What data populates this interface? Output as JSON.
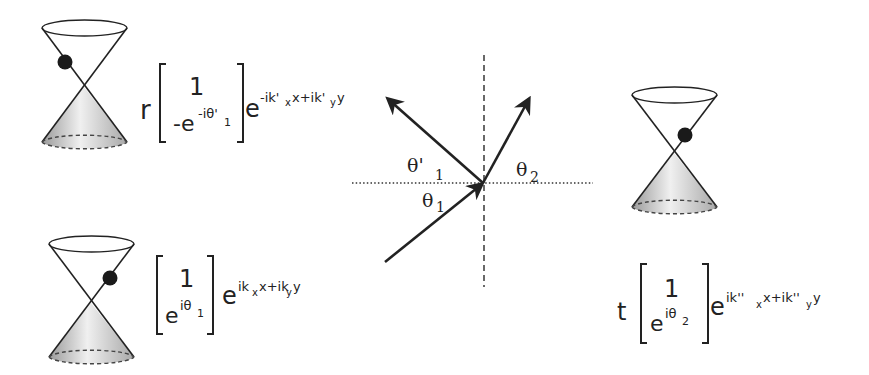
{
  "diagram": {
    "colors": {
      "ink": "#222222",
      "cone_fill_light": "#f2f2f2",
      "cone_fill_dark": "#b8b8b8",
      "ball": "#1a1a1a",
      "background": "#ffffff"
    },
    "reflected": {
      "coefficient": "r",
      "spinor_top": "1",
      "spinor_bottom": "-e",
      "spinor_bottom_exp": "-iθ'",
      "spinor_bottom_sub": "1",
      "exp_base": "e",
      "exp_part1": "-ik'",
      "exp_sub1": "x",
      "exp_part2": "x+ik'",
      "exp_sub2": "y",
      "exp_part3": "y"
    },
    "incident": {
      "coefficient": "",
      "spinor_top": "1",
      "spinor_bottom": "e",
      "spinor_bottom_exp": "iθ",
      "spinor_bottom_sub": "1",
      "exp_base": "e",
      "exp_part1": "ik",
      "exp_sub1": "x",
      "exp_part2": "x+ik",
      "exp_sub2": "y",
      "exp_part3": "y"
    },
    "transmitted": {
      "coefficient": "t",
      "spinor_top": "1",
      "spinor_bottom": "e",
      "spinor_bottom_exp": "iθ",
      "spinor_bottom_sub": "2",
      "exp_base": "e",
      "exp_part1": "ik''",
      "exp_sub1": "x",
      "exp_part2": "x+ik''",
      "exp_sub2": "y",
      "exp_part3": "y"
    },
    "angles": {
      "reflected_label": "θ'",
      "reflected_sub": "1",
      "incident_label": "θ",
      "incident_sub": "1",
      "transmitted_label": "θ",
      "transmitted_sub": "2"
    }
  }
}
